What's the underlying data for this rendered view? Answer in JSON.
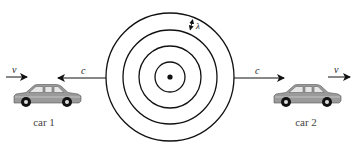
{
  "diagram": {
    "type": "doppler-effect-wavefronts",
    "source": {
      "name": "point-source",
      "cx": 170,
      "cy": 77
    },
    "wavefront_radii": [
      15,
      31,
      47,
      64
    ],
    "wavelength_label": "λ",
    "wave_speed_label": "c",
    "car_speed_label": "v",
    "cars": [
      {
        "id": "car1",
        "label": "car 1",
        "direction": "right",
        "position": "left"
      },
      {
        "id": "car2",
        "label": "car 2",
        "direction": "right",
        "position": "right"
      }
    ],
    "colors": {
      "line": "#111111",
      "car_body": "#9a9a9a",
      "car_window": "#e6e6e6",
      "wheel": "#111111",
      "label_text": "#444444"
    }
  }
}
